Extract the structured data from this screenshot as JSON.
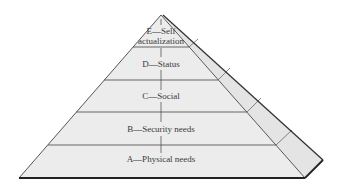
{
  "diagram": {
    "type": "pyramid",
    "colors": {
      "face_fill": "#ececec",
      "side_fill": "#e4e4e4",
      "edge_stroke": "#555555",
      "shadow_stroke": "#222222",
      "text": "#3a3a3a"
    },
    "levels": [
      {
        "id": "E",
        "label_line1": "E—Self",
        "label_line2": "actualization"
      },
      {
        "id": "D",
        "label": "D—Status"
      },
      {
        "id": "C",
        "label": "C—Social"
      },
      {
        "id": "B",
        "label": "B—Security needs"
      },
      {
        "id": "A",
        "label": "A—Physical needs"
      }
    ]
  }
}
